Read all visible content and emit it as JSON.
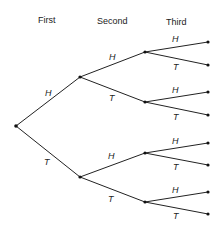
{
  "headers": {
    "first": "First",
    "second": "Second",
    "third": "Third"
  },
  "labels": {
    "l1_H": "H",
    "l1_T": "T",
    "l2_H_H": "H",
    "l2_H_T": "T",
    "l2_T_H": "H",
    "l2_T_T": "T",
    "l3_HH_H": "H",
    "l3_HH_T": "T",
    "l3_HT_H": "H",
    "l3_HT_T": "T",
    "l3_TH_H": "H",
    "l3_TH_T": "T",
    "l3_TT_H": "H",
    "l3_TT_T": "T"
  },
  "tree": {
    "description": "Probability tree for three coin tosses",
    "levels": [
      "First",
      "Second",
      "Third"
    ],
    "outcomes_per_toss": [
      "H",
      "T"
    ],
    "leaf_count": 8
  }
}
